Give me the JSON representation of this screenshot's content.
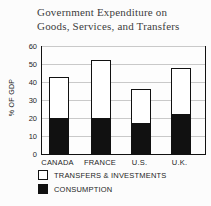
{
  "chart_data": {
    "type": "bar",
    "stacked": true,
    "title": "Government Expenditure on Goods, Services, and Transfers",
    "title_lines": [
      "Government Expenditure on",
      "Goods, Services, and Transfers"
    ],
    "ylabel": "% OF GDP",
    "ylim": [
      0,
      60
    ],
    "yticks": [
      0,
      10,
      20,
      30,
      40,
      50,
      60
    ],
    "grid": true,
    "categories": [
      "CANADA",
      "FRANCE",
      "U.S.",
      "U.K."
    ],
    "series": [
      {
        "name": "CONSUMPTION",
        "color": "#111111",
        "values": [
          20,
          20,
          17,
          22
        ]
      },
      {
        "name": "TRANSFERS & INVESTMENTS",
        "color": "#ffffff",
        "values": [
          23,
          32,
          19,
          26
        ]
      }
    ],
    "totals": [
      43,
      52,
      36,
      48
    ],
    "legend": [
      {
        "label": "TRANSFERS & INVESTMENTS",
        "swatch": "#ffffff"
      },
      {
        "label": "CONSUMPTION",
        "swatch": "#111111"
      }
    ],
    "legend_position": "bottom-left"
  },
  "colors": {
    "bar_fill": "#111111",
    "bar_outline": "#111111",
    "grid_line": "#c9c9c9",
    "axis": "#111111",
    "title_text": "#3d3d3d",
    "label_text": "#1e1e1e",
    "background": "#fcfcfc"
  }
}
